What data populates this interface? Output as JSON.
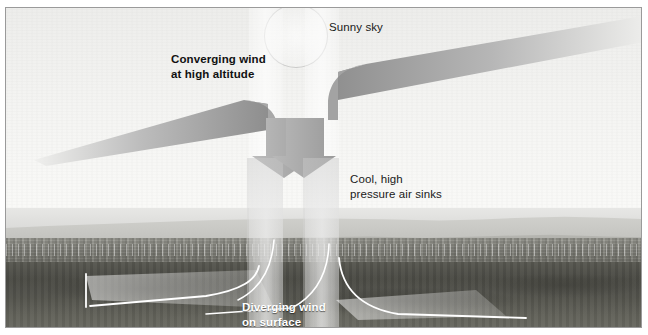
{
  "figure": {
    "type": "diagram",
    "width": 648,
    "height": 335
  },
  "labels": {
    "converging": "Converging wind\nat high altitude",
    "sunny": "Sunny sky",
    "cool": "Cool, high\npressure air sinks",
    "diverging": "Diverging wind\non surface"
  },
  "elements": {
    "sun_name": "sun-disc",
    "left_arrow_name": "converging-wind-arrow-left",
    "right_arrow_name": "converging-wind-arrow-right",
    "column_left_name": "sinking-air-column-left",
    "column_right_name": "sinking-air-column-right",
    "diverging_line_left_name": "diverging-wind-line-left",
    "diverging_line_right_name": "diverging-wind-line-right"
  },
  "colors": {
    "arrow_dark": "#8c8c8c",
    "arrow_light": "#d9d9d9",
    "sky_top": "#ededeb",
    "sky_bottom": "#fafaf8",
    "land_far": "#d2d2ce",
    "land_near": "#4c4c46",
    "label_text": "#111111",
    "label_text_white": "#ffffff",
    "frame_border": "#9a9a9a",
    "surface_line": "#ffffff"
  }
}
